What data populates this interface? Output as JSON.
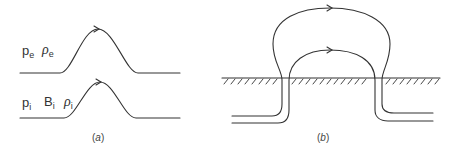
{
  "figure": {
    "panel_a": {
      "caption": "(a)",
      "caption_letter": "a",
      "external_labels": [
        {
          "base": "p",
          "sub": "e",
          "kind": "pressure"
        },
        {
          "base": "ρ",
          "sub": "e",
          "kind": "density"
        }
      ],
      "internal_labels": [
        {
          "base": "p",
          "sub": "i",
          "kind": "pressure"
        },
        {
          "base": "B",
          "sub": "i",
          "kind": "field"
        },
        {
          "base": "ρ",
          "sub": "i",
          "kind": "density"
        }
      ]
    },
    "panel_b": {
      "caption": "(b)",
      "caption_letter": "b"
    },
    "colors": {
      "line": "#333333",
      "background": "#ffffff"
    }
  }
}
